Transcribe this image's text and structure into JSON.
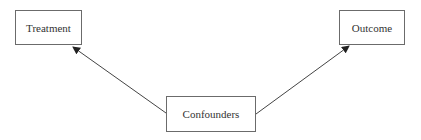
{
  "diagram": {
    "type": "causal-dag",
    "nodes": [
      {
        "id": "treatment",
        "label": "Treatment",
        "x": 15,
        "y": 10,
        "w": 67,
        "h": 35
      },
      {
        "id": "outcome",
        "label": "Outcome",
        "x": 339,
        "y": 10,
        "w": 66,
        "h": 35
      },
      {
        "id": "confounders",
        "label": "Confounders",
        "x": 166,
        "y": 96,
        "w": 90,
        "h": 36
      }
    ],
    "edges": [
      {
        "from": "confounders",
        "to": "treatment",
        "x1": 166,
        "y1": 113,
        "x2": 73,
        "y2": 47
      },
      {
        "from": "confounders",
        "to": "outcome",
        "x1": 256,
        "y1": 114,
        "x2": 349,
        "y2": 46
      }
    ],
    "colors": {
      "border": "#6b6b6b",
      "arrow": "#333333",
      "text": "#333333",
      "background": "#ffffff"
    }
  }
}
